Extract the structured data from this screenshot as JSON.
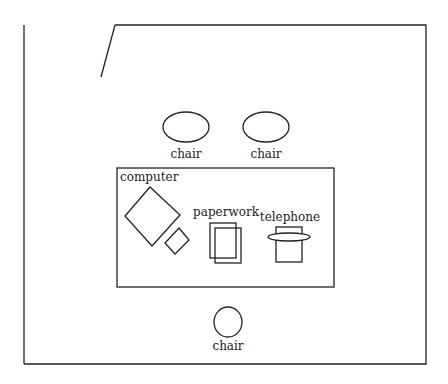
{
  "diagram": {
    "type": "office floor plan",
    "colors": {
      "stroke": "#222222",
      "background": "#ffffff"
    },
    "labels": {
      "chair_top_left": "chair",
      "chair_top_right": "chair",
      "chair_bottom": "chair",
      "computer": "computer",
      "paperwork": "paperwork",
      "telephone": "telephone"
    }
  }
}
